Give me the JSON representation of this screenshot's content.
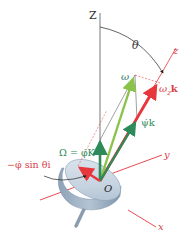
{
  "diagram": {
    "labels": {
      "Z_axis": "Z",
      "z_axis": "z",
      "x_axis": "x",
      "y_axis": "y",
      "theta": "θ",
      "origin": "O",
      "omega": "ω",
      "omega_z_k": "ω",
      "omega_z_k_sub": "z",
      "omega_z_k_unit": "k",
      "Omega": "Ω = φ̇K",
      "psi_dot_k": "ψ̇k",
      "phi_sin_theta_i": "−φ̇ sin θi"
    },
    "colors": {
      "red": "#e8373c",
      "red_label": "#d8424a",
      "green_dark": "#2e8a58",
      "green_light": "#8bc34a",
      "axis_gray": "#555555",
      "disk_top": "#c9d6e3",
      "disk_side": "#9fb1c4",
      "teal_label": "#2f7a6a"
    }
  }
}
